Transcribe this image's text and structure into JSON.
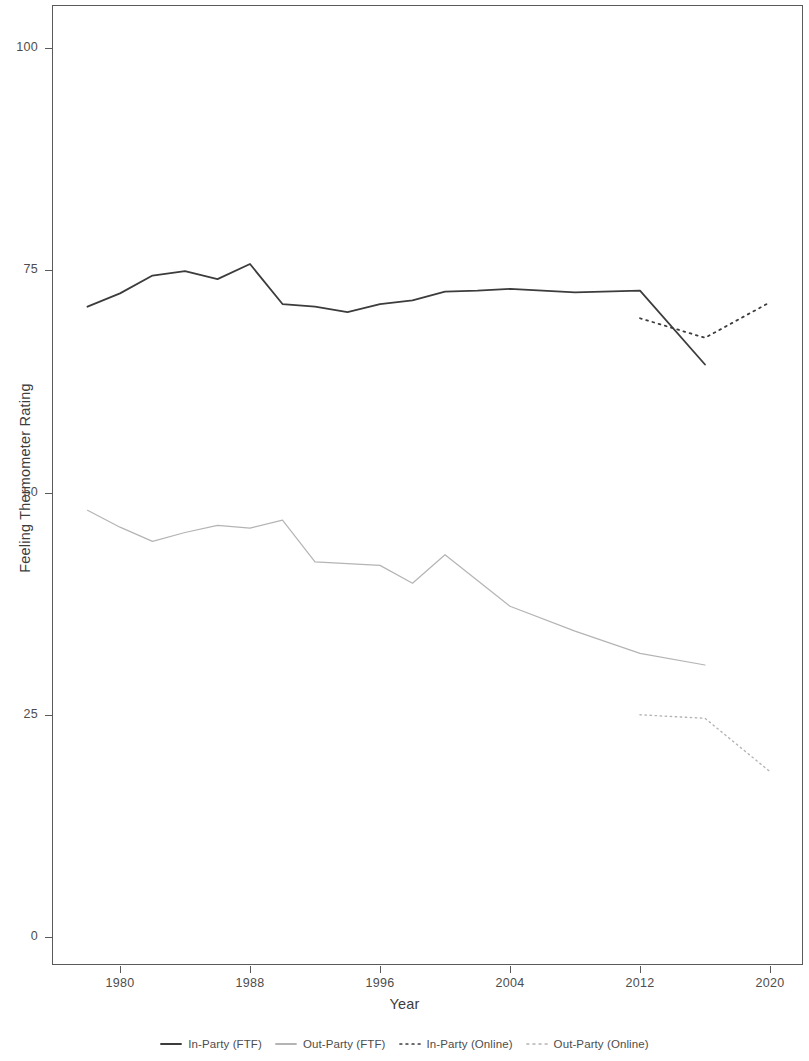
{
  "chart_data": {
    "type": "line",
    "title": "",
    "xlabel": "Year",
    "ylabel": "Feeling Thermometer Rating",
    "xlim": [
      1977,
      2021
    ],
    "ylim": [
      0,
      105
    ],
    "xticks": [
      1980,
      1988,
      1996,
      2004,
      2012,
      2020
    ],
    "xtick_labels": [
      "1980",
      "1988",
      "1996",
      "2004",
      "2012",
      "2020"
    ],
    "yticks": [
      0,
      25,
      50,
      75,
      100
    ],
    "ytick_labels": [
      "0",
      "25",
      "50",
      "75",
      "100"
    ],
    "grid": false,
    "legend_position": "bottom",
    "series": [
      {
        "name": "In-Party (FTF)",
        "style": "solid",
        "color": "#3c3c3c",
        "width": 1.8,
        "x": [
          1978,
          1980,
          1982,
          1984,
          1986,
          1988,
          1990,
          1992,
          1994,
          1996,
          1998,
          2000,
          2002,
          2004,
          2008,
          2012,
          2016
        ],
        "y": [
          70.9,
          72.4,
          74.4,
          74.9,
          74.0,
          75.7,
          71.2,
          70.9,
          70.3,
          71.2,
          71.6,
          72.6,
          72.7,
          72.9,
          72.5,
          72.7,
          64.4
        ]
      },
      {
        "name": "Out-Party (FTF)",
        "style": "solid",
        "color": "#b4b4b4",
        "width": 1.2,
        "x": [
          1978,
          1980,
          1982,
          1984,
          1986,
          1988,
          1990,
          1992,
          1994,
          1996,
          1998,
          2000,
          2002,
          2004,
          2008,
          2012,
          2016
        ],
        "y": [
          48.0,
          46.1,
          44.5,
          45.5,
          46.3,
          46.0,
          46.9,
          42.2,
          42.0,
          41.8,
          39.8,
          43.0,
          40.1,
          37.2,
          34.4,
          31.9,
          30.6
        ]
      },
      {
        "name": "In-Party (Online)",
        "style": "dotted",
        "color": "#3c3c3c",
        "width": 1.8,
        "x": [
          2012,
          2016,
          2020
        ],
        "y": [
          69.6,
          67.4,
          71.4
        ]
      },
      {
        "name": "Out-Party (Online)",
        "style": "dotted",
        "color": "#b4b4b4",
        "width": 1.4,
        "x": [
          2012,
          2016,
          2020
        ],
        "y": [
          25.0,
          24.6,
          18.6
        ]
      }
    ]
  },
  "legend": {
    "items": [
      {
        "label": "In-Party (FTF)",
        "style": "solid",
        "color": "#3c3c3c"
      },
      {
        "label": "Out-Party (FTF)",
        "style": "solid",
        "color": "#b4b4b4"
      },
      {
        "label": "In-Party (Online)",
        "style": "dotted",
        "color": "#3c3c3c"
      },
      {
        "label": "Out-Party (Online)",
        "style": "dotted",
        "color": "#b4b4b4"
      }
    ]
  }
}
